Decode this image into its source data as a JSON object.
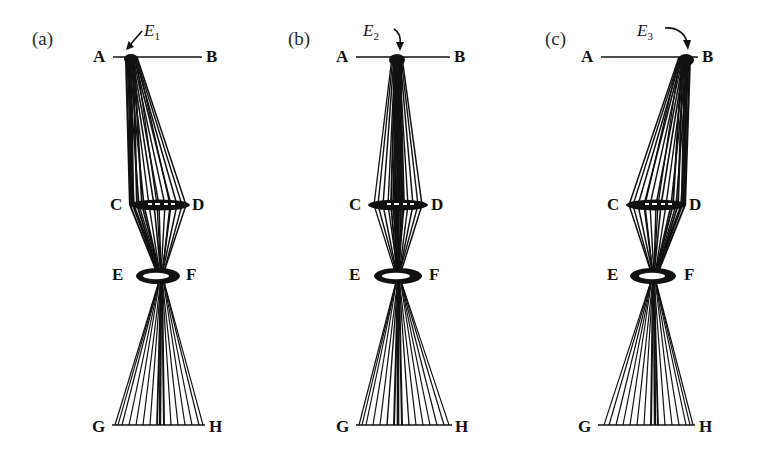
{
  "figure": {
    "background": "#ffffff",
    "ink": "#111111",
    "panels": [
      {
        "id": "a",
        "label": "(a)",
        "entry_label": "E",
        "entry_subscript": "1",
        "entry_label_full": "E1",
        "arrow_direction": "down-right-to-left",
        "entry_side": "left",
        "points": {
          "A": "A",
          "B": "B",
          "C": "C",
          "D": "D",
          "E": "E",
          "F": "F",
          "G": "G",
          "H": "H"
        }
      },
      {
        "id": "b",
        "label": "(b)",
        "entry_label": "E",
        "entry_subscript": "2",
        "entry_label_full": "E2",
        "arrow_direction": "down-right",
        "entry_side": "center",
        "points": {
          "A": "A",
          "B": "B",
          "C": "C",
          "D": "D",
          "E": "E",
          "F": "F",
          "G": "G",
          "H": "H"
        }
      },
      {
        "id": "c",
        "label": "(c)",
        "entry_label": "E",
        "entry_subscript": "3",
        "entry_label_full": "E3",
        "arrow_direction": "down-right",
        "entry_side": "right",
        "points": {
          "A": "A",
          "B": "B",
          "C": "C",
          "D": "D",
          "E": "E",
          "F": "F",
          "G": "G",
          "H": "H"
        }
      }
    ],
    "geometry": {
      "ab_line_y": 57,
      "cd_lens_y": 205,
      "ef_lens_y": 275,
      "gh_line_y": 425,
      "ab_x_start": 113,
      "ab_x_end": 202,
      "gh_x_start": 112,
      "gh_x_end": 205,
      "cd_half_width": 30,
      "ef_half_width": 22,
      "entry_x_a": 130,
      "entry_x_b": 139,
      "entry_x_c": 178
    },
    "caption_elements": {
      "lens_cd_name": "lens-CD",
      "lens_ef_name": "lens-EF",
      "ray_bundle_name": "ray-bundle"
    }
  }
}
